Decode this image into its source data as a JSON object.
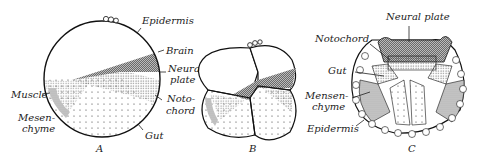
{
  "figure": {
    "panels": [
      {
        "id": "A",
        "label": "A",
        "labels": [
          "Epidermis",
          "Brain",
          "Neural",
          "plate",
          "Noto-",
          "chord",
          "Gut",
          "Muscle",
          "Mesen-",
          "chyme"
        ]
      },
      {
        "id": "B",
        "label": "B"
      },
      {
        "id": "C",
        "label": "C",
        "labels": [
          "Neural plate",
          "Notochord",
          "Gut",
          "Mensen-",
          "chyme",
          "Epidermis"
        ]
      }
    ]
  }
}
